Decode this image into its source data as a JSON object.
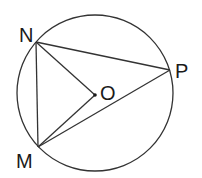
{
  "diagram": {
    "type": "geometry-circle-inscribed-triangle",
    "colors": {
      "stroke": "#333333",
      "text": "#1a1a1a",
      "background": "#ffffff"
    },
    "circle": {
      "cx": 95,
      "cy": 93,
      "r": 78,
      "center_label": "O"
    },
    "points": [
      {
        "id": "N",
        "label": "N",
        "x": 36,
        "y": 42,
        "label_x": 19,
        "label_y": 42
      },
      {
        "id": "M",
        "label": "M",
        "x": 38,
        "y": 147,
        "label_x": 16,
        "label_y": 168
      },
      {
        "id": "P",
        "label": "P",
        "x": 170,
        "y": 70,
        "label_x": 175,
        "label_y": 78
      },
      {
        "id": "O",
        "label": "O",
        "x": 95,
        "y": 95,
        "label_x": 100,
        "label_y": 100
      }
    ],
    "segments": [
      {
        "from": "N",
        "to": "P"
      },
      {
        "from": "N",
        "to": "M"
      },
      {
        "from": "M",
        "to": "P"
      },
      {
        "from": "N",
        "to": "O"
      },
      {
        "from": "M",
        "to": "O"
      }
    ]
  }
}
